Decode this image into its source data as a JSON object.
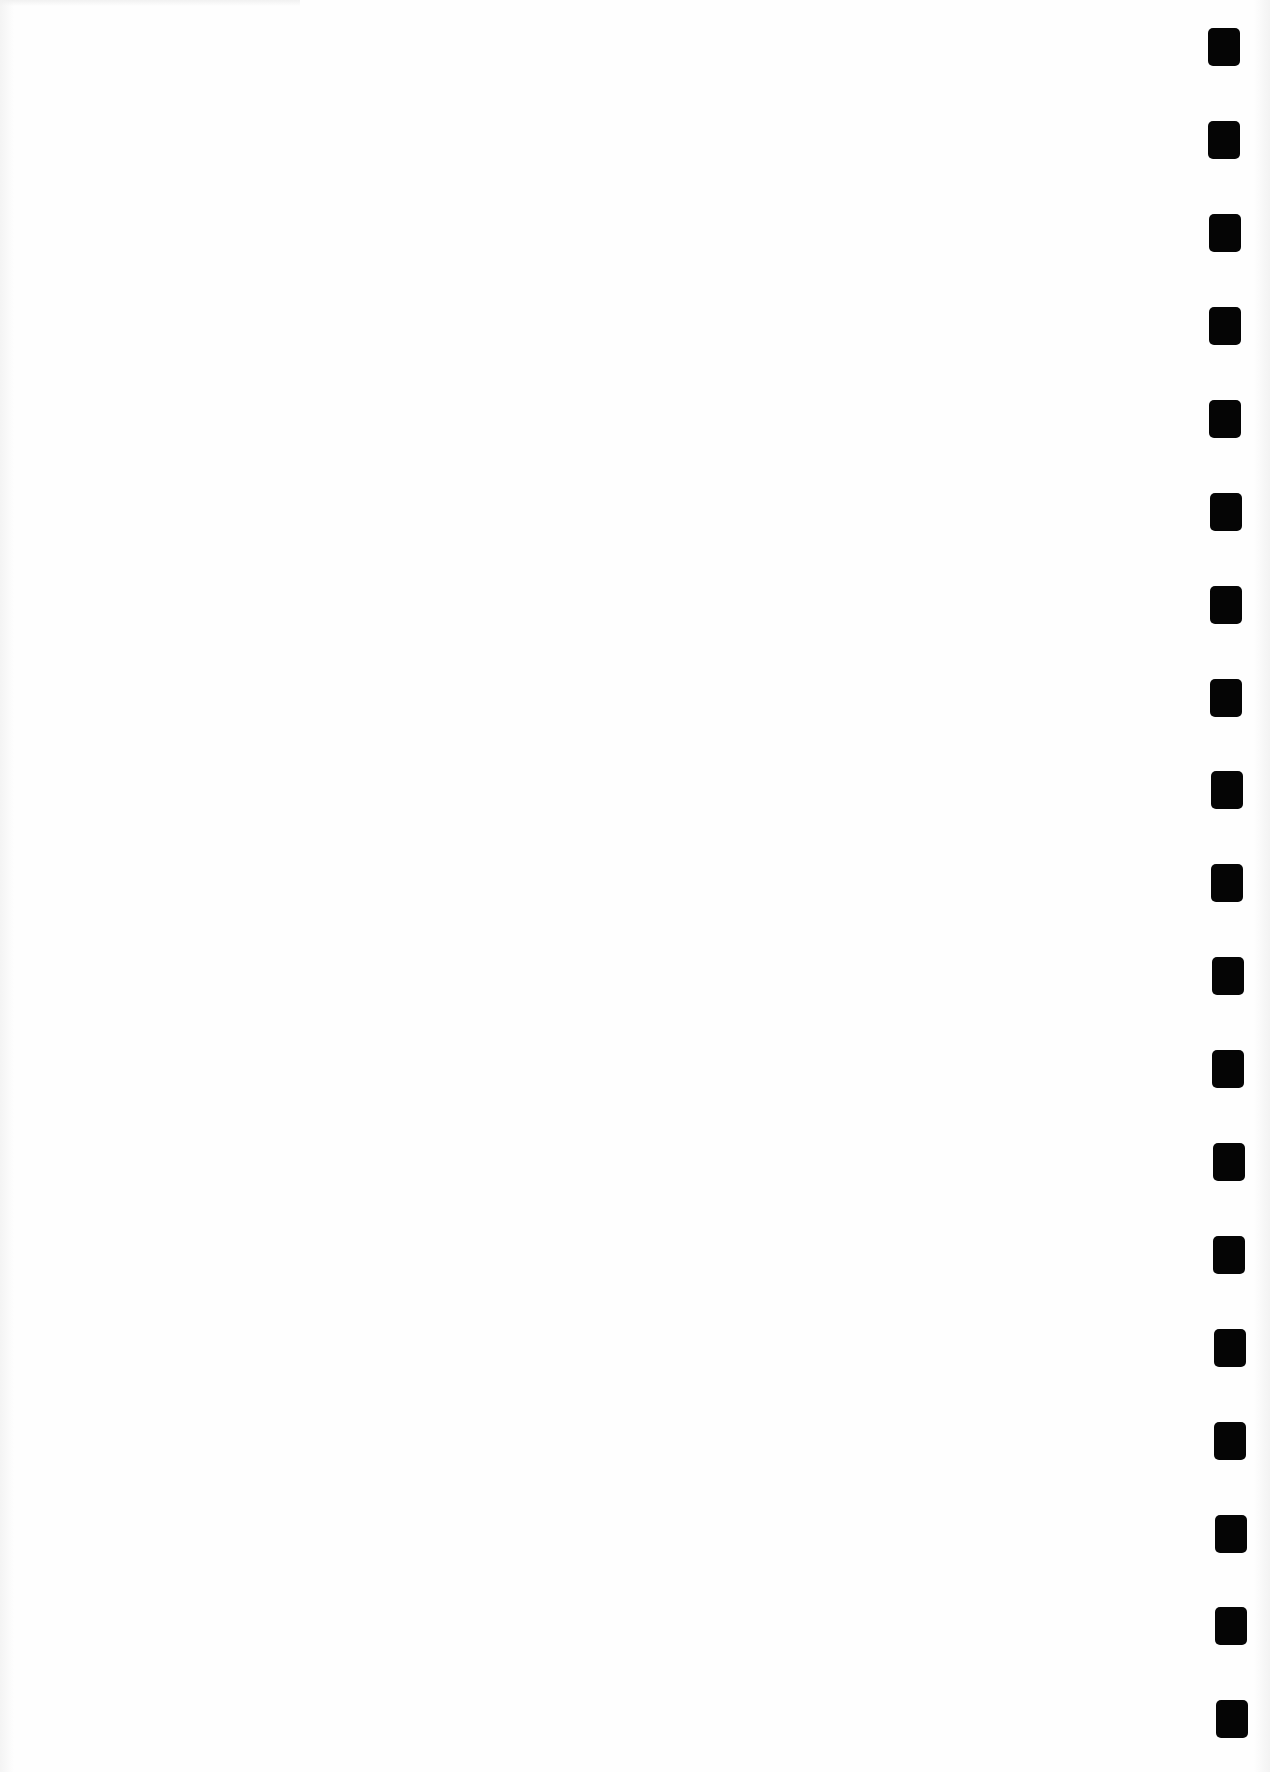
{
  "page": {
    "type": "scanned blank page",
    "background_color": "#fefefe",
    "text_content": ""
  },
  "punch_holes": {
    "count": 19,
    "color": "#050505",
    "side": "right",
    "positions": [
      {
        "x": 1208,
        "y": 28
      },
      {
        "x": 1208,
        "y": 121
      },
      {
        "x": 1209,
        "y": 214
      },
      {
        "x": 1209,
        "y": 307
      },
      {
        "x": 1209,
        "y": 400
      },
      {
        "x": 1210,
        "y": 493
      },
      {
        "x": 1210,
        "y": 586
      },
      {
        "x": 1210,
        "y": 679
      },
      {
        "x": 1211,
        "y": 771
      },
      {
        "x": 1211,
        "y": 864
      },
      {
        "x": 1212,
        "y": 957
      },
      {
        "x": 1212,
        "y": 1050
      },
      {
        "x": 1213,
        "y": 1143
      },
      {
        "x": 1213,
        "y": 1236
      },
      {
        "x": 1214,
        "y": 1329
      },
      {
        "x": 1214,
        "y": 1422
      },
      {
        "x": 1215,
        "y": 1515
      },
      {
        "x": 1215,
        "y": 1607
      },
      {
        "x": 1216,
        "y": 1700
      }
    ]
  }
}
